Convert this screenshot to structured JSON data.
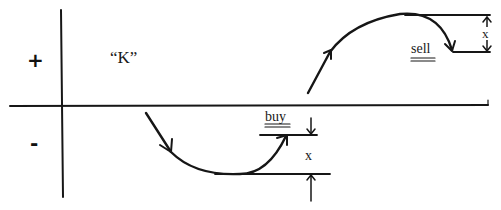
{
  "diagram": {
    "quadrant_labels": {
      "positive": "+",
      "negative": "-"
    },
    "curve_label": "“K”",
    "buy_label": "buy",
    "sell_label": "sell",
    "buy_gap_label": "x",
    "sell_gap_label": "x",
    "colors": {
      "ink": "#161616",
      "background": "#ffffff"
    }
  }
}
